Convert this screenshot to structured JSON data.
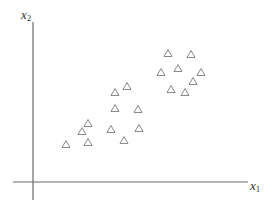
{
  "chart_data": {
    "type": "scatter",
    "title": "",
    "xlabel": "x",
    "xlabel_sub": "1",
    "ylabel": "x",
    "ylabel_sub": "2",
    "marker": "triangle-open",
    "ticks": "none",
    "grid": false,
    "legend": null,
    "units": "relative position from axis origin (no tick labels shown)",
    "xlim": [
      0,
      215
    ],
    "ylim": [
      0,
      160
    ],
    "series": [
      {
        "name": "points",
        "points": [
          {
            "x": 135,
            "y": 129
          },
          {
            "x": 158,
            "y": 128
          },
          {
            "x": 145,
            "y": 114
          },
          {
            "x": 128,
            "y": 110
          },
          {
            "x": 168,
            "y": 110
          },
          {
            "x": 160,
            "y": 101
          },
          {
            "x": 138,
            "y": 93
          },
          {
            "x": 152,
            "y": 90
          },
          {
            "x": 94,
            "y": 96
          },
          {
            "x": 82,
            "y": 90
          },
          {
            "x": 82,
            "y": 74
          },
          {
            "x": 105,
            "y": 73
          },
          {
            "x": 78,
            "y": 53
          },
          {
            "x": 106,
            "y": 54
          },
          {
            "x": 91,
            "y": 42
          },
          {
            "x": 55,
            "y": 59
          },
          {
            "x": 49,
            "y": 51
          },
          {
            "x": 33,
            "y": 38
          },
          {
            "x": 55,
            "y": 40
          }
        ]
      }
    ]
  },
  "layout": {
    "origin_px": [
      33,
      182
    ],
    "x_axis_px": [
      13,
      248
    ],
    "y_axis_px": [
      22,
      200
    ],
    "marker_size_px": 8,
    "colors": {
      "axis": "#6b6b6b",
      "marker": "#7a7a7a",
      "label": "#333333",
      "background": "#ffffff"
    }
  }
}
